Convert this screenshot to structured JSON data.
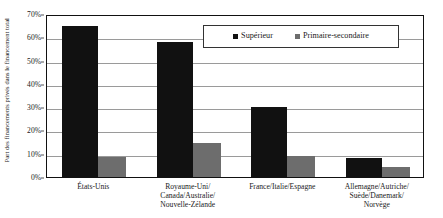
{
  "chart_data": {
    "type": "bar",
    "title": "",
    "xlabel": "",
    "ylabel": "Part des financements privés dans le financement total",
    "ylim": [
      0,
      70
    ],
    "ytick_labels": [
      "0%",
      "10%",
      "20%",
      "30%",
      "40%",
      "50%",
      "60%",
      "70%"
    ],
    "ytick_values": [
      0,
      10,
      20,
      30,
      40,
      50,
      60,
      70
    ],
    "grid": true,
    "legend_position": "top-right-inside",
    "categories": [
      "États-Unis",
      "Royaume-Uni/\nCanada/Australie/\nNouvelle-Zélande",
      "France/Italie/Espagne",
      "Allemagne/Autriche/\nSuède/Danemark/\nNorvège"
    ],
    "series": [
      {
        "name": "Supérieur",
        "color": "#111111",
        "values": [
          65,
          58,
          30,
          8
        ]
      },
      {
        "name": "Primaire-secondaire",
        "color": "#6d6d6d",
        "values": [
          8.5,
          14.5,
          9,
          4.5
        ]
      }
    ]
  },
  "legend": {
    "items": [
      {
        "label": "Supérieur"
      },
      {
        "label": "Primaire-secondaire"
      }
    ]
  },
  "colors": {
    "superieur": "#111111",
    "primaire_secondaire": "#6d6d6d",
    "axis": "#111111",
    "gridline": "#9a9a9a"
  }
}
